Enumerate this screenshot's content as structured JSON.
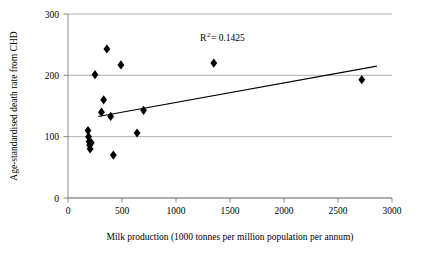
{
  "chart_data": {
    "type": "scatter",
    "title": "",
    "xlabel": "Milk production (1000 tonnes per million population per annum)",
    "ylabel": "Age-standardised death rate from CHD",
    "xlim": [
      0,
      3000
    ],
    "ylim": [
      0,
      300
    ],
    "xticks": [
      0,
      500,
      1000,
      1500,
      2000,
      2500,
      3000
    ],
    "yticks": [
      0,
      100,
      200,
      300
    ],
    "xtick_labels": [
      "0",
      "500",
      "1000",
      "1500",
      "2000",
      "2500",
      "3000"
    ],
    "ytick_labels": [
      "0",
      "100",
      "200",
      "300"
    ],
    "grid": "horizontal",
    "legend": "none",
    "marker": "diamond",
    "marker_color": "#000000",
    "annotations": [
      {
        "name": "r-squared",
        "text_prefix": "R",
        "text_sup": "2",
        "text_suffix": " = 0.1425",
        "value": 0.1425,
        "x": 1400,
        "y": 265
      }
    ],
    "points": [
      {
        "x": 185,
        "y": 110
      },
      {
        "x": 190,
        "y": 100
      },
      {
        "x": 195,
        "y": 92
      },
      {
        "x": 200,
        "y": 86
      },
      {
        "x": 205,
        "y": 80
      },
      {
        "x": 215,
        "y": 90
      },
      {
        "x": 250,
        "y": 201
      },
      {
        "x": 310,
        "y": 140
      },
      {
        "x": 330,
        "y": 160
      },
      {
        "x": 360,
        "y": 243
      },
      {
        "x": 395,
        "y": 133
      },
      {
        "x": 420,
        "y": 70
      },
      {
        "x": 490,
        "y": 217
      },
      {
        "x": 640,
        "y": 106
      },
      {
        "x": 700,
        "y": 143
      },
      {
        "x": 1350,
        "y": 220
      },
      {
        "x": 2720,
        "y": 193
      }
    ],
    "trendline": {
      "name": "linear-fit",
      "x_start": 280,
      "y_start": 133,
      "x_end": 2860,
      "y_end": 215
    }
  }
}
